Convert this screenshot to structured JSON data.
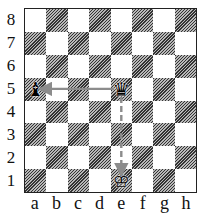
{
  "board": {
    "ranks": [
      "8",
      "7",
      "6",
      "5",
      "4",
      "3",
      "2",
      "1"
    ],
    "files": [
      "a",
      "b",
      "c",
      "d",
      "e",
      "f",
      "g",
      "h"
    ],
    "pieces": [
      {
        "square": "a5",
        "piece": "black-bishop",
        "glyph": "♝"
      },
      {
        "square": "e5",
        "piece": "black-queen",
        "glyph": "♛"
      },
      {
        "square": "e1",
        "piece": "white-king",
        "glyph": "♔"
      }
    ],
    "arrows": [
      {
        "from": "e5",
        "to": "a5",
        "style": "solid",
        "color": "#8c8c8c"
      },
      {
        "from": "e5",
        "to": "e1",
        "style": "dashed",
        "color": "#8c8c8c"
      }
    ]
  },
  "colors": {
    "light_square": "#ffffff",
    "dark_square": "#9a9a9a",
    "border": "#222222",
    "arrow": "#8c8c8c"
  }
}
